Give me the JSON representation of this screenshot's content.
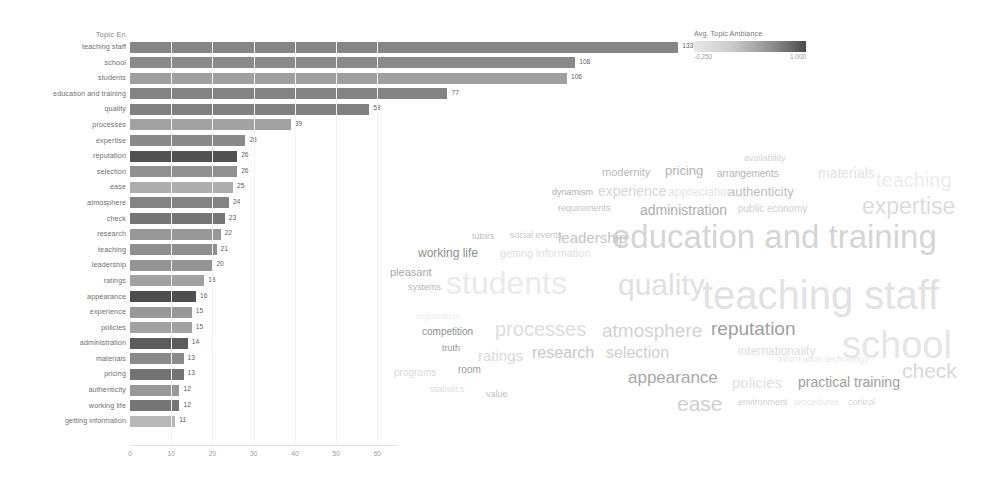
{
  "bar_chart": {
    "axis_title": "Topic En",
    "x_ticks": [
      "0",
      "10",
      "20",
      "30",
      "40",
      "50",
      "60"
    ]
  },
  "legend": {
    "title": "Avg. Topic Ambiance",
    "min": "-0.250",
    "max": "1.000"
  },
  "chart_data": {
    "type": "bar",
    "title": "Topic En",
    "xlabel": "",
    "ylabel": "Topic En",
    "orientation": "horizontal",
    "xlim": [
      0,
      65
    ],
    "grid": true,
    "legend_position": "top-right",
    "colorbar": {
      "label": "Avg. Topic Ambiance",
      "min": -0.25,
      "max": 1.0
    },
    "categories": [
      "teaching staff",
      "school",
      "students",
      "education and training",
      "quality",
      "processes",
      "expertise",
      "reputation",
      "selection",
      "ease",
      "atmosphere",
      "check",
      "research",
      "teaching",
      "leadership",
      "ratings",
      "appearance",
      "experience",
      "policies",
      "administration",
      "materials",
      "pricing",
      "authenticity",
      "working life",
      "getting information"
    ],
    "values": [
      133,
      108,
      106,
      77,
      58,
      39,
      28,
      26,
      26,
      25,
      24,
      23,
      22,
      21,
      20,
      18,
      16,
      15,
      15,
      14,
      13,
      13,
      12,
      12,
      11
    ],
    "ambiance": [
      0.42,
      0.45,
      0.6,
      0.4,
      0.38,
      0.62,
      0.45,
      0.05,
      0.5,
      0.7,
      0.4,
      0.3,
      0.55,
      0.48,
      0.52,
      0.62,
      0.02,
      0.55,
      0.62,
      0.12,
      0.45,
      0.28,
      0.55,
      0.3,
      0.78
    ]
  },
  "word_cloud": {
    "words": [
      {
        "text": "teaching staff",
        "size": 40,
        "shade": "#e2e2e2",
        "x": 322,
        "y": 135
      },
      {
        "text": "education and training",
        "size": 33,
        "shade": "#d5d5d5",
        "x": 232,
        "y": 80
      },
      {
        "text": "school",
        "size": 38,
        "shade": "#e6e6e6",
        "x": 462,
        "y": 186
      },
      {
        "text": "students",
        "size": 32,
        "shade": "#eaeaea",
        "x": 66,
        "y": 127
      },
      {
        "text": "quality",
        "size": 30,
        "shade": "#e0e0e0",
        "x": 238,
        "y": 130
      },
      {
        "text": "expertise",
        "size": 23,
        "shade": "#dcdcdc",
        "x": 482,
        "y": 55
      },
      {
        "text": "check",
        "size": 21,
        "shade": "#d8d8d8",
        "x": 522,
        "y": 220
      },
      {
        "text": "teaching",
        "size": 20,
        "shade": "#ececec",
        "x": 496,
        "y": 30
      },
      {
        "text": "processes",
        "size": 20,
        "shade": "#dcdcdc",
        "x": 115,
        "y": 179
      },
      {
        "text": "atmosphere",
        "size": 19,
        "shade": "#d2d2d2",
        "x": 222,
        "y": 181
      },
      {
        "text": "reputation",
        "size": 19,
        "shade": "#9f9f9f",
        "x": 331,
        "y": 179
      },
      {
        "text": "ease",
        "size": 21,
        "shade": "#d0d0d0",
        "x": 297,
        "y": 253
      },
      {
        "text": "appearance",
        "size": 17,
        "shade": "#a8a8a8",
        "x": 248,
        "y": 229
      },
      {
        "text": "selection",
        "size": 16,
        "shade": "#cfcfcf",
        "x": 226,
        "y": 205
      },
      {
        "text": "research",
        "size": 16,
        "shade": "#c8c8c8",
        "x": 152,
        "y": 205
      },
      {
        "text": "ratings",
        "size": 15,
        "shade": "#d8d8d8",
        "x": 98,
        "y": 208
      },
      {
        "text": "leadership",
        "size": 15,
        "shade": "#c5c5c5",
        "x": 178,
        "y": 90
      },
      {
        "text": "policies",
        "size": 15,
        "shade": "#dfdfdf",
        "x": 352,
        "y": 235
      },
      {
        "text": "practical training",
        "size": 14,
        "shade": "#9e9e9e",
        "x": 418,
        "y": 235
      },
      {
        "text": "administration",
        "size": 14,
        "shade": "#adadad",
        "x": 260,
        "y": 63
      },
      {
        "text": "internationality",
        "size": 12,
        "shade": "#dcdcdc",
        "x": 358,
        "y": 205
      },
      {
        "text": "authenticity",
        "size": 13,
        "shade": "#bdbdbd",
        "x": 348,
        "y": 45
      },
      {
        "text": "experience",
        "size": 14,
        "shade": "#d6d6d6",
        "x": 218,
        "y": 44
      },
      {
        "text": "materials",
        "size": 14,
        "shade": "#e2e2e2",
        "x": 438,
        "y": 26
      },
      {
        "text": "arrangements",
        "size": 10,
        "shade": "#b5b5b5",
        "x": 337,
        "y": 29
      },
      {
        "text": "pricing",
        "size": 13,
        "shade": "#b2b2b2",
        "x": 285,
        "y": 24
      },
      {
        "text": "modernity",
        "size": 11,
        "shade": "#b8b8b8",
        "x": 222,
        "y": 27
      },
      {
        "text": "availability",
        "size": 9,
        "shade": "#d4d4d4",
        "x": 364,
        "y": 14
      },
      {
        "text": "public economy",
        "size": 10,
        "shade": "#cfcfcf",
        "x": 358,
        "y": 64
      },
      {
        "text": "appreciation",
        "size": 12,
        "shade": "#e4e4e4",
        "x": 288,
        "y": 46
      },
      {
        "text": "dynamism",
        "size": 9,
        "shade": "#b0b0b0",
        "x": 172,
        "y": 48
      },
      {
        "text": "requirements",
        "size": 9,
        "shade": "#c2c2c2",
        "x": 178,
        "y": 64
      },
      {
        "text": "working life",
        "size": 12,
        "shade": "#8f8f8f",
        "x": 38,
        "y": 107
      },
      {
        "text": "getting information",
        "size": 11,
        "shade": "#e0e0e0",
        "x": 120,
        "y": 108
      },
      {
        "text": "social events",
        "size": 9,
        "shade": "#c8c8c8",
        "x": 130,
        "y": 91
      },
      {
        "text": "tutors",
        "size": 9,
        "shade": "#bdbdbd",
        "x": 92,
        "y": 92
      },
      {
        "text": "pleasant",
        "size": 11,
        "shade": "#a9a9a9",
        "x": 10,
        "y": 127
      },
      {
        "text": "systems",
        "size": 9,
        "shade": "#b6b6b6",
        "x": 28,
        "y": 143
      },
      {
        "text": "competition",
        "size": 10,
        "shade": "#8e8e8e",
        "x": 42,
        "y": 187
      },
      {
        "text": "registration",
        "size": 9,
        "shade": "#ededed",
        "x": 36,
        "y": 172
      },
      {
        "text": "truth",
        "size": 9,
        "shade": "#969696",
        "x": 62,
        "y": 204
      },
      {
        "text": "programs",
        "size": 10,
        "shade": "#dadada",
        "x": 14,
        "y": 228
      },
      {
        "text": "room",
        "size": 10,
        "shade": "#9b9b9b",
        "x": 78,
        "y": 225
      },
      {
        "text": "statistics",
        "size": 9,
        "shade": "#dedede",
        "x": 50,
        "y": 245
      },
      {
        "text": "value",
        "size": 9,
        "shade": "#c2c2c2",
        "x": 106,
        "y": 250
      },
      {
        "text": "environment",
        "size": 9,
        "shade": "#d0d0d0",
        "x": 358,
        "y": 258
      },
      {
        "text": "procedures",
        "size": 9,
        "shade": "#e6e6e6",
        "x": 414,
        "y": 258
      },
      {
        "text": "control",
        "size": 9,
        "shade": "#d6d6d6",
        "x": 468,
        "y": 258
      },
      {
        "text": "information technology",
        "size": 9,
        "shade": "#e8e8e8",
        "x": 398,
        "y": 215
      }
    ]
  }
}
